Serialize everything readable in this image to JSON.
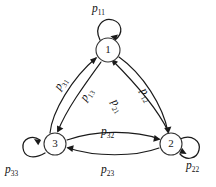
{
  "diagram": {
    "background_color": "#ffffff",
    "stroke_color": "#1a1a1a",
    "node_fill_color": "#ffffff",
    "nodes": [
      {
        "id": "1",
        "label": "1",
        "x": 108,
        "y": 50,
        "r": 12
      },
      {
        "id": "3",
        "label": "3",
        "x": 55,
        "y": 144,
        "r": 11
      },
      {
        "id": "2",
        "label": "2",
        "x": 171,
        "y": 144,
        "r": 11
      }
    ],
    "self_loops": [
      {
        "id": "p11",
        "from": "1",
        "to": "1",
        "p": "p",
        "sub": "11",
        "label_x": 92,
        "label_y": 3
      },
      {
        "id": "p33",
        "from": "3",
        "to": "3",
        "p": "p",
        "sub": "33",
        "label_x": 5,
        "label_y": 164
      },
      {
        "id": "p22",
        "from": "2",
        "to": "2",
        "p": "p",
        "sub": "22",
        "label_x": 186,
        "label_y": 160
      }
    ],
    "edges": [
      {
        "id": "p31",
        "from": "3",
        "to": "1",
        "p": "p",
        "sub": "31",
        "label_x": 52,
        "label_y": 86,
        "rotate": -58
      },
      {
        "id": "p13",
        "from": "1",
        "to": "3",
        "p": "p",
        "sub": "13",
        "label_x": 78,
        "label_y": 97,
        "rotate": -58
      },
      {
        "id": "p21",
        "from": "2",
        "to": "1",
        "p": "p",
        "sub": "21",
        "label_x": 119,
        "label_y": 97,
        "rotate": 58
      },
      {
        "id": "p12",
        "from": "1",
        "to": "2",
        "p": "p",
        "sub": "12",
        "label_x": 148,
        "label_y": 86,
        "rotate": 58
      },
      {
        "id": "p32",
        "from": "3",
        "to": "2",
        "p": "p",
        "sub": "32",
        "label_x": 101,
        "label_y": 126,
        "rotate": 0
      },
      {
        "id": "p23",
        "from": "2",
        "to": "3",
        "p": "p",
        "sub": "23",
        "label_x": 101,
        "label_y": 164,
        "rotate": 0
      }
    ]
  }
}
